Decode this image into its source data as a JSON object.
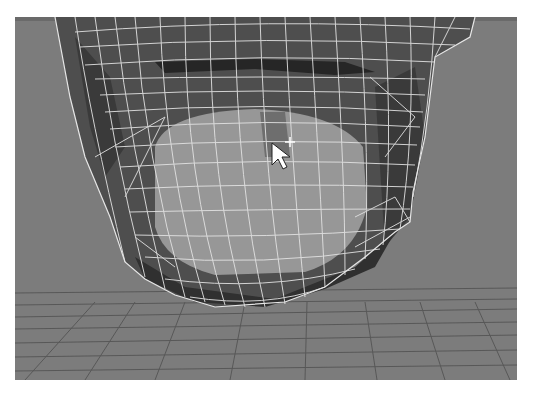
{
  "viewport": {
    "name": "3D perspective viewport",
    "content": "polygon head mesh wireframe - lower face / chin",
    "background_color": "#7c7c7c",
    "grid_line_color": "#555555",
    "wire_color": "#e6e6e6",
    "selected_face_color": "#9a9a9a",
    "dark_face_color": "#3c3c3c",
    "mid_face_color": "#5a5a5a"
  },
  "top_strip": {
    "highlights": [
      {
        "x": 185,
        "w": 30
      },
      {
        "x": 392,
        "w": 35
      }
    ]
  },
  "cursor": {
    "icon": "arrow-pointer-icon",
    "modifier_icon": "move-crosshair-icon",
    "x": 272,
    "y": 142
  }
}
